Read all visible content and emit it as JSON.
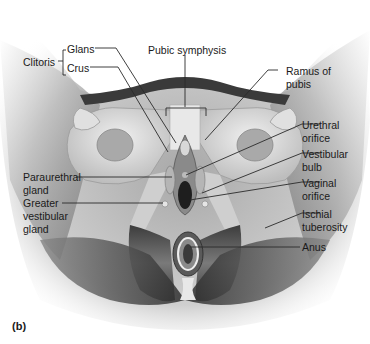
{
  "figure": {
    "panel_letter": "(b)",
    "labels": {
      "clitoris": "Clitoris",
      "glans": "Glans",
      "crus": "Crus",
      "pubic_symphysis": "Pubic symphysis",
      "ramus_of_pubis_line1": "Ramus of",
      "ramus_of_pubis_line2": "pubis",
      "urethral_orifice_line1": "Urethral",
      "urethral_orifice_line2": "orifice",
      "vestibular_bulb_line1": "Vestibular",
      "vestibular_bulb_line2": "bulb",
      "vaginal_orifice_line1": "Vaginal",
      "vaginal_orifice_line2": "orifice",
      "ischial_tuberosity_line1": "Ischial",
      "ischial_tuberosity_line2": "tuberosity",
      "anus": "Anus",
      "paraurethral_gland_line1": "Paraurethral",
      "paraurethral_gland_line2": "gland",
      "greater_vestibular_gland_line1": "Greater",
      "greater_vestibular_gland_line2": "vestibular",
      "greater_vestibular_gland_line3": "gland"
    },
    "colors": {
      "leader_line": "#2a2a2a",
      "bone": "#d9d9d9",
      "muscle": "#5a5a5a",
      "background": "#ffffff"
    }
  }
}
